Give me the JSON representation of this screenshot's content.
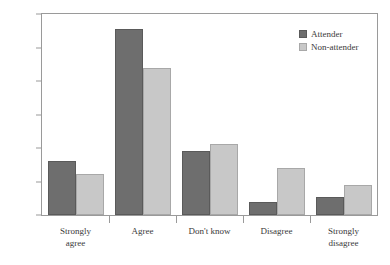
{
  "chart_data": {
    "type": "bar",
    "title": "",
    "subtitle": "",
    "xlabel": "",
    "ylabel": "",
    "categories": [
      "Strongly\nagree",
      "Agree",
      "Don't know",
      "Disagree",
      "Strongly\ndisagree"
    ],
    "series": [
      {
        "name": "Attender",
        "color": "#6e6e6e",
        "values": [
          16.0,
          55.5,
          19.0,
          4.0,
          5.5
        ]
      },
      {
        "name": "Non-attender",
        "color": "#c8c8c8",
        "values": [
          12.3,
          44.0,
          21.2,
          14.0,
          9.0
        ]
      }
    ],
    "ylim": [
      0,
      60
    ],
    "ytick_values": [
      0,
      10,
      20,
      30,
      40,
      50,
      60
    ],
    "ytick_labels": [
      "0%",
      "10%",
      "20%",
      "30%",
      "40%",
      "50%",
      "60%"
    ],
    "grid": false,
    "legend_position": "top-right"
  }
}
